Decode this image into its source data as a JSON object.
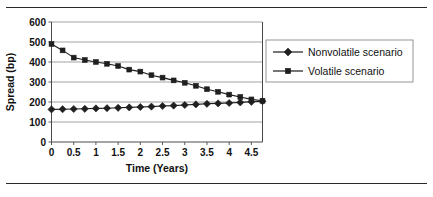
{
  "figure": {
    "rule_color": "#2b2b2b",
    "background": "#ffffff"
  },
  "chart_data": {
    "type": "line",
    "title": "",
    "xlabel": "Time (Years)",
    "ylabel": "Spread (bp)",
    "xlim": [
      0,
      4.75
    ],
    "ylim": [
      0,
      600
    ],
    "xticks": [
      0,
      0.5,
      1,
      1.5,
      2,
      2.5,
      3,
      3.5,
      4,
      4.5
    ],
    "xtick_labels": [
      "0",
      "0.5",
      "1",
      "1.5",
      "2",
      "2.5",
      "3",
      "3.5",
      "4",
      "4.5"
    ],
    "yticks": [
      0,
      100,
      200,
      300,
      400,
      500,
      600
    ],
    "ytick_labels": [
      "0",
      "100",
      "200",
      "300",
      "400",
      "500",
      "600"
    ],
    "grid": "horizontal",
    "legend_position": "right",
    "x": [
      0,
      0.25,
      0.5,
      0.75,
      1,
      1.25,
      1.5,
      1.75,
      2,
      2.25,
      2.5,
      2.75,
      3,
      3.25,
      3.5,
      3.75,
      4,
      4.25,
      4.5,
      4.75
    ],
    "series": [
      {
        "name": "Nonvolatile scenario",
        "marker": "diamond",
        "color": "#1f1f1f",
        "values": [
          163,
          164,
          165,
          166,
          168,
          169,
          171,
          173,
          175,
          177,
          180,
          182,
          185,
          188,
          191,
          193,
          195,
          198,
          201,
          204
        ]
      },
      {
        "name": "Volatile scenario",
        "marker": "square",
        "color": "#1f1f1f",
        "values": [
          490,
          458,
          422,
          410,
          400,
          391,
          380,
          362,
          352,
          334,
          322,
          308,
          296,
          281,
          264,
          251,
          237,
          225,
          213,
          206
        ]
      }
    ]
  },
  "legend": {
    "entries": [
      {
        "label": "Nonvolatile scenario",
        "marker": "diamond"
      },
      {
        "label": "Volatile scenario",
        "marker": "square"
      }
    ]
  }
}
